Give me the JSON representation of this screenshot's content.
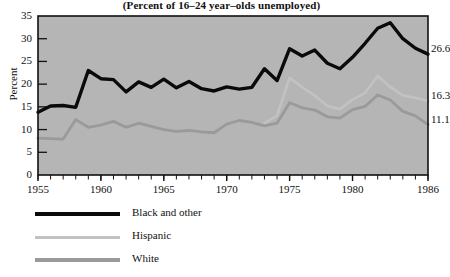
{
  "chart_data": {
    "type": "line",
    "title": "(Percent of 16–24 year–olds unemployed)",
    "xlabel": "",
    "ylabel": "Percent",
    "xlim": [
      1955,
      1986
    ],
    "ylim": [
      0,
      35
    ],
    "grid": false,
    "legend_position": "below",
    "y_ticks": [
      0,
      5,
      10,
      15,
      20,
      25,
      30,
      35
    ],
    "y_tick_labels": [
      "0",
      "5",
      "10",
      "15",
      "20",
      "25",
      "30",
      "35"
    ],
    "x_ticks": [
      1955,
      1960,
      1965,
      1970,
      1975,
      1980,
      1986
    ],
    "x_tick_labels": [
      "1955",
      "1960",
      "1965",
      "1970",
      "1975",
      "1980",
      "1986"
    ],
    "x_minor_tick_interval": 1,
    "series": [
      {
        "name": "Black and other",
        "color": "#0a0a0a",
        "width": 3.4,
        "end_label": "26.6",
        "x": [
          1955,
          1956,
          1957,
          1958,
          1959,
          1960,
          1961,
          1962,
          1963,
          1964,
          1965,
          1966,
          1967,
          1968,
          1969,
          1970,
          1971,
          1972,
          1973,
          1974,
          1975,
          1976,
          1977,
          1978,
          1979,
          1980,
          1981,
          1982,
          1983,
          1984,
          1985,
          1986
        ],
        "values": [
          13.8,
          15.2,
          15.3,
          14.9,
          23.0,
          21.2,
          21.0,
          18.3,
          20.5,
          19.3,
          21.1,
          19.2,
          20.6,
          19.0,
          18.5,
          19.4,
          18.9,
          19.3,
          23.4,
          20.8,
          27.8,
          26.2,
          27.5,
          24.6,
          23.4,
          25.9,
          29.0,
          32.3,
          33.5,
          30.0,
          27.9,
          26.6
        ]
      },
      {
        "name": "Hispanic",
        "color": "#c2c2c2",
        "width": 2.6,
        "end_label": "16.3",
        "x": [
          1973,
          1974,
          1975,
          1976,
          1977,
          1978,
          1979,
          1980,
          1981,
          1982,
          1983,
          1984,
          1985,
          1986
        ],
        "values": [
          11.4,
          13.1,
          21.4,
          19.3,
          17.5,
          15.2,
          14.5,
          16.6,
          18.1,
          21.8,
          19.4,
          17.5,
          17.0,
          16.3
        ]
      },
      {
        "name": "White",
        "color": "#9a9a9a",
        "width": 2.8,
        "end_label": "11.1",
        "x": [
          1955,
          1956,
          1957,
          1958,
          1959,
          1960,
          1961,
          1962,
          1963,
          1964,
          1965,
          1966,
          1967,
          1968,
          1969,
          1970,
          1971,
          1972,
          1973,
          1974,
          1975,
          1976,
          1977,
          1978,
          1979,
          1980,
          1981,
          1982,
          1983,
          1984,
          1985,
          1986
        ],
        "values": [
          8.1,
          8.0,
          7.9,
          12.2,
          10.5,
          11.0,
          11.8,
          10.5,
          11.4,
          10.7,
          10.0,
          9.6,
          9.8,
          9.5,
          9.3,
          11.2,
          12.0,
          11.6,
          10.8,
          11.4,
          15.9,
          14.8,
          14.3,
          12.8,
          12.5,
          14.4,
          15.1,
          17.6,
          16.5,
          14.0,
          13.0,
          11.1
        ]
      }
    ]
  },
  "plot": {
    "background": "#b5b5b5",
    "border": "#111111"
  },
  "legend": {
    "items": [
      {
        "label": "Black and other",
        "color": "#0a0a0a",
        "width": 4.0
      },
      {
        "label": "Hispanic",
        "color": "#c2c2c2",
        "width": 3.0
      },
      {
        "label": "White",
        "color": "#9a9a9a",
        "width": 3.2
      }
    ]
  }
}
